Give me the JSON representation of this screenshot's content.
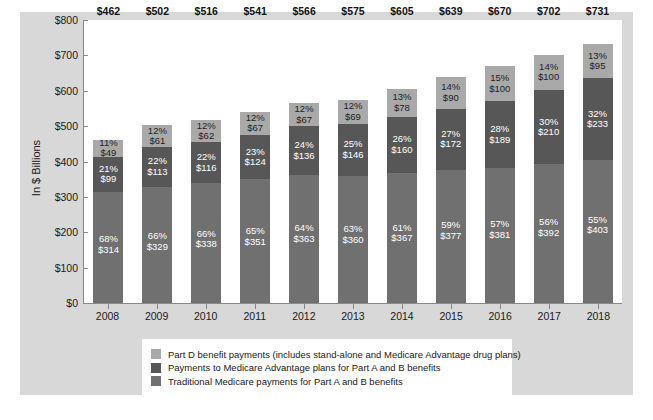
{
  "chart_data": {
    "type": "bar",
    "subtype": "stacked-bar",
    "title": "",
    "xlabel": "",
    "ylabel": "In $ Billions",
    "ylim": [
      0,
      800
    ],
    "ytick_labels": [
      "$800",
      "$700",
      "$600",
      "$500",
      "$400",
      "$300",
      "$200",
      "$100",
      "$0"
    ],
    "ytick_values": [
      800,
      700,
      600,
      500,
      400,
      300,
      200,
      100,
      0
    ],
    "grid": false,
    "legend_position": "bottom",
    "categories": [
      "2008",
      "2009",
      "2010",
      "2011",
      "2012",
      "2013",
      "2014",
      "2015",
      "2016",
      "2017",
      "2018"
    ],
    "totals": [
      462,
      502,
      516,
      541,
      566,
      575,
      605,
      639,
      670,
      702,
      731
    ],
    "total_labels": [
      "$462",
      "$502",
      "$516",
      "$541",
      "$566",
      "$575",
      "$605",
      "$639",
      "$670",
      "$702",
      "$731"
    ],
    "series": [
      {
        "name": "Traditional Medicare payments for Part A and B benefits",
        "key": "trad",
        "color": "#707070",
        "values": [
          314,
          329,
          338,
          351,
          363,
          360,
          367,
          377,
          381,
          392,
          403
        ],
        "value_labels": [
          "$314",
          "$329",
          "$338",
          "$351",
          "$363",
          "$360",
          "$367",
          "$377",
          "$381",
          "$392",
          "$403"
        ],
        "pct_labels": [
          "68%",
          "66%",
          "66%",
          "65%",
          "64%",
          "63%",
          "61%",
          "59%",
          "57%",
          "56%",
          "55%"
        ]
      },
      {
        "name": "Payments to Medicare Advantage plans for Part A and B benefits",
        "key": "ma",
        "color": "#575757",
        "values": [
          99,
          113,
          116,
          124,
          136,
          146,
          160,
          172,
          189,
          210,
          233
        ],
        "value_labels": [
          "$99",
          "$113",
          "$116",
          "$124",
          "$136",
          "$146",
          "$160",
          "$172",
          "$189",
          "$210",
          "$233"
        ],
        "pct_labels": [
          "21%",
          "22%",
          "22%",
          "23%",
          "24%",
          "25%",
          "26%",
          "27%",
          "28%",
          "30%",
          "32%"
        ]
      },
      {
        "name": "Part D benefit payments (includes stand-alone and Medicare Advantage drug plans)",
        "key": "partd",
        "color": "#a9a9a9",
        "values": [
          49,
          61,
          62,
          67,
          67,
          69,
          78,
          90,
          100,
          100,
          95
        ],
        "value_labels": [
          "$49",
          "$61",
          "$62",
          "$67",
          "$67",
          "$69",
          "$78",
          "$90",
          "$100",
          "$100",
          "$95"
        ],
        "pct_labels": [
          "11%",
          "12%",
          "12%",
          "12%",
          "12%",
          "12%",
          "13%",
          "14%",
          "15%",
          "14%",
          "13%"
        ]
      }
    ]
  },
  "legend": {
    "items": [
      {
        "key": "partd",
        "color": "#a9a9a9",
        "label": "Part D benefit payments (includes stand-alone and Medicare Advantage drug plans)"
      },
      {
        "key": "ma",
        "color": "#575757",
        "label": "Payments to Medicare Advantage plans for Part A and B benefits"
      },
      {
        "key": "trad",
        "color": "#707070",
        "label": "Traditional Medicare payments for Part A and B benefits"
      }
    ]
  }
}
